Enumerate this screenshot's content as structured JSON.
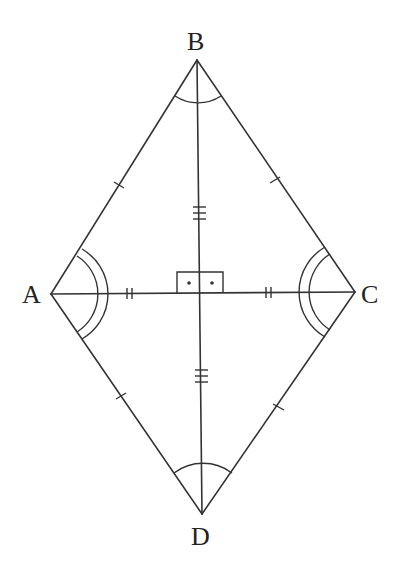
{
  "diagram": {
    "vertices": {
      "A": {
        "label": "A",
        "x": 51,
        "y": 294
      },
      "B": {
        "label": "B",
        "x": 197,
        "y": 60
      },
      "C": {
        "label": "C",
        "x": 355,
        "y": 292
      },
      "D": {
        "label": "D",
        "x": 202,
        "y": 514
      }
    },
    "markings": {
      "sides": "single tick on each side (AB = BC = CD = DA)",
      "half_diagonal_AC": "double ticks",
      "half_diagonal_BD": "triple ticks",
      "right_angle": "square with two dots at intersection",
      "angles_A_C": "double arcs",
      "angles_B_D": "single arcs"
    },
    "colors": {
      "stroke": "#333333",
      "background": "#ffffff"
    }
  }
}
